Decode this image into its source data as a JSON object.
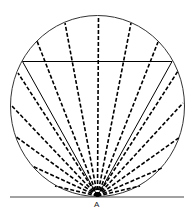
{
  "diagram": {
    "point_label": "A",
    "circle": {
      "cx": 97.5,
      "cy": 106,
      "rx": 87,
      "ry": 90.5
    },
    "apex": {
      "x": 97.5,
      "y": 196
    },
    "baseline": {
      "x1": 10,
      "x2": 184,
      "y": 197
    },
    "chord": {
      "x1": 22.5,
      "x2": 172,
      "y": 61.5
    },
    "solid_rays": [
      [
        22.5,
        61.5
      ],
      [
        172,
        61.5
      ]
    ],
    "dashed_rays": [
      [
        98.5,
        16
      ],
      [
        65,
        23
      ],
      [
        37,
        41
      ],
      [
        18,
        73
      ],
      [
        11,
        105
      ],
      [
        15,
        136
      ],
      [
        32,
        166
      ],
      [
        55,
        186
      ],
      [
        131,
        23
      ],
      [
        158,
        42
      ],
      [
        178,
        71
      ],
      [
        183,
        103
      ],
      [
        180,
        137
      ],
      [
        162,
        168
      ],
      [
        140,
        186
      ]
    ],
    "colors": {
      "line": "#000000",
      "circle": "#333333"
    }
  }
}
